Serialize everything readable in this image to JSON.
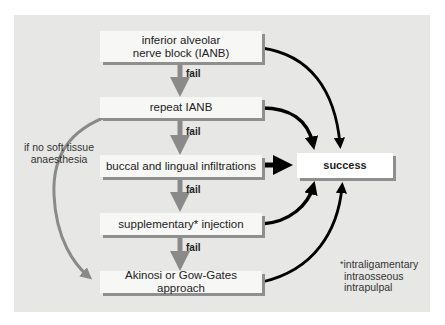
{
  "diagram": {
    "nodes": [
      {
        "id": "ianb",
        "label_lines": [
          "inferior alveolar",
          "nerve block (IANB)"
        ]
      },
      {
        "id": "repeat",
        "label_lines": [
          "repeat IANB"
        ]
      },
      {
        "id": "infiltrations",
        "label_lines": [
          "buccal and lingual infiltrations"
        ]
      },
      {
        "id": "supplementary",
        "label_lines": [
          "supplementary* injection"
        ]
      },
      {
        "id": "akinosi",
        "label_lines": [
          "Akinosi or Gow-Gates approach"
        ]
      },
      {
        "id": "success",
        "label_lines": [
          "success"
        ]
      }
    ],
    "fail_label": "fail",
    "edges": [
      {
        "from": "ianb",
        "to": "repeat",
        "label": "fail"
      },
      {
        "from": "repeat",
        "to": "infiltrations",
        "label": "fail"
      },
      {
        "from": "infiltrations",
        "to": "supplementary",
        "label": "fail"
      },
      {
        "from": "supplementary",
        "to": "akinosi",
        "label": "fail"
      },
      {
        "from": "ianb",
        "to": "success"
      },
      {
        "from": "repeat",
        "to": "success"
      },
      {
        "from": "infiltrations",
        "to": "success"
      },
      {
        "from": "supplementary",
        "to": "success"
      },
      {
        "from": "akinosi",
        "to": "success"
      },
      {
        "from": "repeat",
        "to": "akinosi",
        "label": "if no soft tissue anaesthesia"
      }
    ],
    "side_note_lines": [
      "if no soft tissue",
      "anaesthesia"
    ],
    "footnote": {
      "marker": "*",
      "lines": [
        "intraligamentary",
        "intraosseous",
        "intrapulpal"
      ]
    }
  },
  "colors": {
    "panel": "#e7e7e5",
    "box": "#f7f7f5",
    "fail_arrow": "#8a8a8a",
    "success_arrow": "#000000",
    "curve_arrow": "#8a8a8a"
  }
}
